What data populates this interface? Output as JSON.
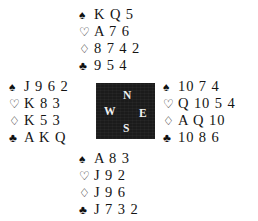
{
  "diagram": {
    "type": "bridge-deal-diagram",
    "background_color": "#ffffff",
    "text_color": "#141414",
    "compass_box_color": "#1b1b1b",
    "compass_label_color": "#f2f2f2"
  },
  "suits": {
    "spade": {
      "name": "spade-suit-symbol",
      "glyph": "♠"
    },
    "heart": {
      "name": "heart-suit-symbol",
      "glyph": "♡"
    },
    "diamond": {
      "name": "diamond-suit-symbol",
      "glyph": "♢"
    },
    "club": {
      "name": "club-suit-symbol",
      "glyph": "♣"
    }
  },
  "compass": {
    "north": "N",
    "west": "W",
    "east": "E",
    "south": "S"
  },
  "hands": {
    "north": {
      "label": "North",
      "spades": "K Q 5",
      "hearts": "A 7 6",
      "diamonds": "8 7 4 2",
      "clubs": "9 5 4"
    },
    "west": {
      "label": "West",
      "spades": "J 9 6 2",
      "hearts": "K 8 3",
      "diamonds": "K 5 3",
      "clubs": "A K Q"
    },
    "east": {
      "label": "East",
      "spades": "10 7 4",
      "hearts": "Q 10 5 4",
      "diamonds": "A Q 10",
      "clubs": "10 8 6"
    },
    "south": {
      "label": "South",
      "spades": "A 8 3",
      "hearts": "J 9 2",
      "diamonds": "J 9 6",
      "clubs": "J 7 3 2"
    }
  }
}
